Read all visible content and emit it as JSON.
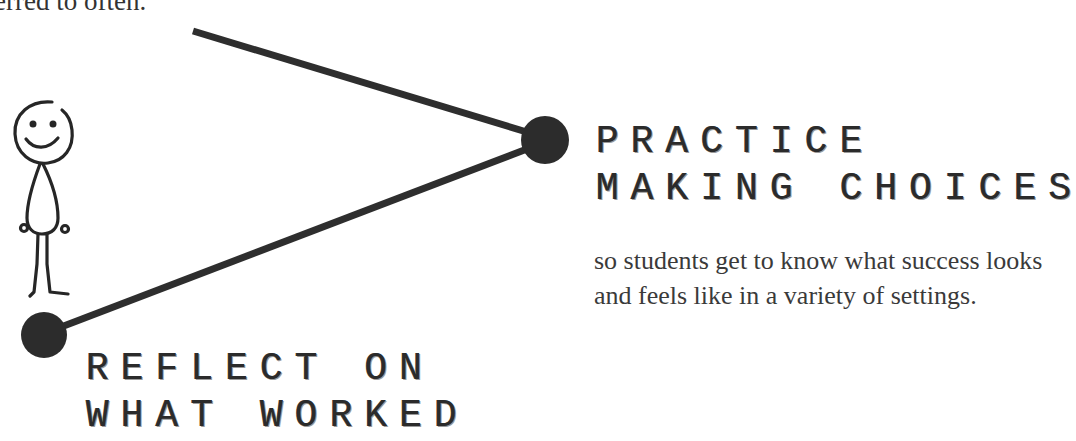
{
  "top_fragment": "erred to often.",
  "nodes": [
    {
      "id": "practice",
      "title_lines": [
        "PRACTICE",
        "MAKING CHOICES"
      ],
      "description": "so students get to know what success looks and feels like in a variety of settings."
    },
    {
      "id": "reflect",
      "title_lines": [
        "REFLECT ON",
        "WHAT WORKED"
      ]
    }
  ],
  "figure": {
    "icon": "stick-figure-smiling"
  },
  "colors": {
    "ink": "#2b2b2b",
    "text": "#3a3a3a",
    "background": "#ffffff"
  }
}
